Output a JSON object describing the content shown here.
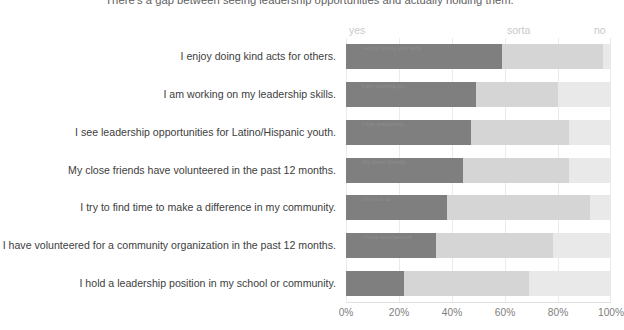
{
  "chart_data": {
    "type": "bar",
    "subtype": "horizontal-stacked-100",
    "title": "There's a gap between seeing leadership opportunities and actually holding them.",
    "xlabel": "",
    "ylabel": "",
    "xlim": [
      0,
      100
    ],
    "xticks": [
      "0%",
      "20%",
      "40%",
      "60%",
      "80%",
      "100%"
    ],
    "xtick_values": [
      0,
      20,
      40,
      60,
      80,
      100
    ],
    "grid": true,
    "legend_position": "top",
    "legend": [
      "yes",
      "sorta",
      "no"
    ],
    "series": [
      {
        "name": "yes",
        "color": "#7f7f7f",
        "values": [
          59,
          49,
          47,
          44,
          38,
          34,
          22
        ]
      },
      {
        "name": "sorta",
        "color": "#d5d5d5",
        "values": [
          38,
          31,
          37,
          40,
          54,
          44,
          47
        ]
      },
      {
        "name": "no",
        "color": "#e9e9e9",
        "values": [
          3,
          20,
          16,
          16,
          8,
          22,
          31
        ]
      }
    ],
    "categories": [
      "I enjoy doing kind acts for others.",
      "I am working on my leadership skills.",
      "I see leadership opportunities for Latino/Hispanic youth.",
      "My close friends have volunteered in the past 12 months.",
      "I try to find time to make a difference in my community.",
      "I have volunteered for a community organization in the past 12 months.",
      "I hold a leadership position in my school or community."
    ],
    "bar_labels": [
      "I enjoy doing kind acts",
      "I am working on",
      "I see leadership",
      "My close friends",
      "I try to find",
      "I have volunteered",
      ""
    ]
  },
  "colors": {
    "yes": "#7f7f7f",
    "sorta": "#d5d5d5",
    "no": "#e9e9e9",
    "gridline": "#eceaea",
    "label_text": "#404040",
    "tick_text": "#808080",
    "legend_text": "#c9c9c9",
    "title_text": "#5e5e5e",
    "background": "#ffffff"
  }
}
